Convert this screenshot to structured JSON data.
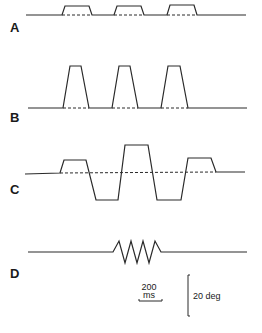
{
  "panels": [
    {
      "label": "A",
      "description": "Three small upward trapezoidal pulses with dashed baseline beneath each"
    },
    {
      "label": "B",
      "description": "Three tall upward trapezoidal pulses with dashed baseline beneath each"
    },
    {
      "label": "C",
      "description": "Alternating up/down trapezoidal steps (small up, large down, large up, large down, small up) with dashed baseline"
    },
    {
      "label": "D",
      "description": "Short burst of four oscillation cycles"
    }
  ],
  "scale_bars": {
    "time_value": "200",
    "time_unit": "ms",
    "amplitude": "20 deg"
  }
}
